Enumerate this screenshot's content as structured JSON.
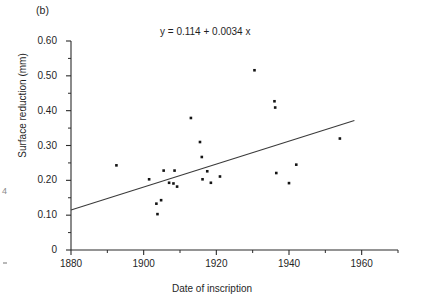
{
  "figure": {
    "panel_label": "(b)",
    "equation_text": "y = 0.114 + 0.0034 x"
  },
  "artifacts": {
    "left_edge_mark": "4"
  },
  "chart_data": {
    "type": "scatter",
    "title": "",
    "subtitle": "",
    "annotations": [
      "(b)",
      "y = 0.114 + 0.0034 x"
    ],
    "xlabel": "Date of inscription",
    "ylabel": "Surface reduction (mm)",
    "xlim": [
      1880,
      1970
    ],
    "ylim": [
      0,
      0.6
    ],
    "xticks": [
      1880,
      1900,
      1920,
      1940,
      1960
    ],
    "xtick_labels": [
      "1880",
      "1900",
      "1920",
      "1940",
      "1960"
    ],
    "x_minor_ticks": [
      1890,
      1910,
      1930,
      1950,
      1970
    ],
    "yticks": [
      0,
      0.1,
      0.2,
      0.3,
      0.4,
      0.5,
      0.6
    ],
    "ytick_labels": [
      "0",
      "0.10",
      "0.20",
      "0.30",
      "0.40",
      "0.50",
      "0.60"
    ],
    "y_minor_ticks": [
      0.05,
      0.15,
      0.25,
      0.35,
      0.45,
      0.55
    ],
    "grid": false,
    "legend": null,
    "marker_style": "filled-square",
    "points": [
      {
        "x": 1892.5,
        "y": 0.243
      },
      {
        "x": 1901.5,
        "y": 0.203
      },
      {
        "x": 1903.5,
        "y": 0.133
      },
      {
        "x": 1903.8,
        "y": 0.103
      },
      {
        "x": 1904.8,
        "y": 0.143
      },
      {
        "x": 1905.5,
        "y": 0.228
      },
      {
        "x": 1907.0,
        "y": 0.193
      },
      {
        "x": 1908.2,
        "y": 0.191
      },
      {
        "x": 1908.5,
        "y": 0.228
      },
      {
        "x": 1909.2,
        "y": 0.182
      },
      {
        "x": 1913.0,
        "y": 0.379
      },
      {
        "x": 1915.5,
        "y": 0.31
      },
      {
        "x": 1916.0,
        "y": 0.267
      },
      {
        "x": 1916.2,
        "y": 0.203
      },
      {
        "x": 1917.5,
        "y": 0.226
      },
      {
        "x": 1918.5,
        "y": 0.193
      },
      {
        "x": 1921.0,
        "y": 0.211
      },
      {
        "x": 1930.5,
        "y": 0.516
      },
      {
        "x": 1936.0,
        "y": 0.427
      },
      {
        "x": 1936.2,
        "y": 0.409
      },
      {
        "x": 1936.5,
        "y": 0.221
      },
      {
        "x": 1940.0,
        "y": 0.192
      },
      {
        "x": 1942.0,
        "y": 0.245
      },
      {
        "x": 1954.0,
        "y": 0.32
      }
    ],
    "fit_line": {
      "equation": "y = 0.114 + 0.0034 x",
      "intercept": 0.114,
      "slope": 0.0034,
      "x_start": 1880,
      "y_start": 0.115,
      "x_end": 1958,
      "y_end": 0.372
    }
  }
}
